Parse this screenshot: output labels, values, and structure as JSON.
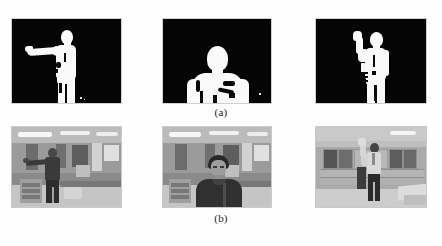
{
  "figure": {
    "rows": [
      {
        "id": "row-a",
        "caption": "(a)",
        "kind": "binary-silhouette-masks",
        "background_color": "#050505",
        "foreground_color": "#fafafa",
        "panels": [
          {
            "index": 1,
            "label": "mask-pointing-left",
            "description": "Binary silhouette of a standing person with the right arm extended horizontally to the left",
            "pose": "arm-extended-left",
            "view": "full-body",
            "subject_position": "center-right"
          },
          {
            "index": 2,
            "label": "mask-close-up-torso",
            "description": "Binary silhouette of a person's head and upper torso filmed close to the camera",
            "pose": "facing-camera",
            "view": "head-and-torso",
            "subject_position": "center"
          },
          {
            "index": 3,
            "label": "mask-hand-raised",
            "description": "Binary silhouette of a standing person with the left arm raised and hand up",
            "pose": "hand-raised",
            "view": "full-body",
            "subject_position": "center"
          }
        ]
      },
      {
        "id": "row-b",
        "caption": "(b)",
        "kind": "grayscale-source-photographs",
        "panels": [
          {
            "index": 1,
            "label": "photo-office-pointing-left",
            "description": "Grayscale photo of an office with desks, cabinets and ceiling lights; a person stands pointing to the left",
            "scene": "office-desks",
            "subject_position": "center-left"
          },
          {
            "index": 2,
            "label": "photo-office-close-up",
            "description": "Grayscale photo of the same office; a person stands close to the camera facing forward",
            "scene": "office-desks",
            "subject_position": "center"
          },
          {
            "index": 3,
            "label": "photo-cabinets-hand-raised",
            "description": "Grayscale photo of a room lined with storage cabinets; a person stands with a hand raised",
            "scene": "cabinet-room",
            "subject_position": "center"
          }
        ]
      }
    ]
  }
}
